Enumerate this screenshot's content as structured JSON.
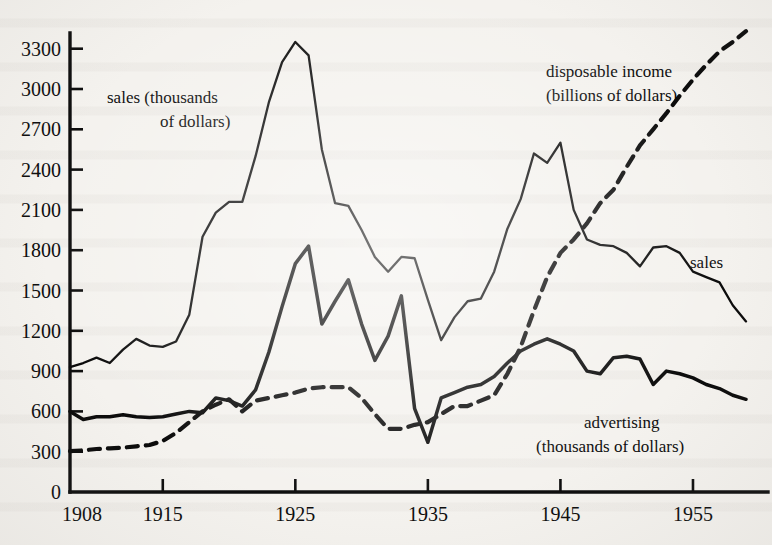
{
  "figure": {
    "background_color": "#f4f2ee",
    "ink_color": "#0b0b0b"
  },
  "axes": {
    "y_ticks": [
      "0",
      "300",
      "600",
      "900",
      "1200",
      "1500",
      "1800",
      "2100",
      "2400",
      "2700",
      "3000",
      "3300"
    ],
    "x_ticks": [
      "1908",
      "1915",
      "1925",
      "1935",
      "1945",
      "1955"
    ]
  },
  "annotations": {
    "sales_main_line1": "sales (thousands",
    "sales_main_line2": "of dollars)",
    "disposable_line1": "disposable income",
    "disposable_line2": "(billions of dollars)",
    "sales_right": "sales",
    "advertising_line1": "advertising",
    "advertising_line2": "(thousands of dollars)"
  },
  "chart_data": {
    "type": "line",
    "title": "",
    "xlabel": "",
    "ylabel": "",
    "xlim": [
      1908,
      1959
    ],
    "ylim": [
      0,
      3450
    ],
    "grid": false,
    "legend": "inline-annotations",
    "x_tick_values": [
      1908,
      1915,
      1925,
      1935,
      1945,
      1955
    ],
    "y_tick_values": [
      0,
      300,
      600,
      900,
      1200,
      1500,
      1800,
      2100,
      2400,
      2700,
      3000,
      3300
    ],
    "x": [
      1908,
      1909,
      1910,
      1911,
      1912,
      1913,
      1914,
      1915,
      1916,
      1917,
      1918,
      1919,
      1920,
      1921,
      1922,
      1923,
      1924,
      1925,
      1926,
      1927,
      1928,
      1929,
      1930,
      1931,
      1932,
      1933,
      1934,
      1935,
      1936,
      1937,
      1938,
      1939,
      1940,
      1941,
      1942,
      1943,
      1944,
      1945,
      1946,
      1947,
      1948,
      1949,
      1950,
      1951,
      1952,
      1953,
      1954,
      1955,
      1956,
      1957,
      1958,
      1959
    ],
    "series": [
      {
        "name": "sales",
        "unit": "thousands of dollars",
        "style": "solid",
        "annotation_left": "sales (thousands of dollars)",
        "annotation_right": "sales",
        "values": [
          930,
          960,
          1000,
          960,
          1060,
          1140,
          1090,
          1080,
          1120,
          1320,
          1900,
          2080,
          2160,
          2160,
          2500,
          2900,
          3200,
          3350,
          3250,
          2550,
          2150,
          2130,
          1950,
          1750,
          1640,
          1750,
          1740,
          1430,
          1130,
          1300,
          1420,
          1440,
          1640,
          1960,
          2180,
          2520,
          2450,
          2600,
          2100,
          1880,
          1840,
          1830,
          1780,
          1680,
          1820,
          1830,
          1780,
          1640,
          1600,
          1560,
          1390,
          1270
        ]
      },
      {
        "name": "advertising",
        "unit": "thousands of dollars",
        "style": "solid",
        "annotation": "advertising (thousands of dollars)",
        "values": [
          600,
          540,
          560,
          560,
          575,
          560,
          555,
          560,
          580,
          600,
          590,
          700,
          680,
          640,
          760,
          1040,
          1380,
          1700,
          1830,
          1250,
          1420,
          1580,
          1250,
          980,
          1160,
          1460,
          620,
          370,
          700,
          740,
          780,
          800,
          860,
          960,
          1050,
          1100,
          1140,
          1100,
          1050,
          900,
          880,
          1000,
          1010,
          990,
          800,
          900,
          880,
          850,
          800,
          770,
          720,
          690
        ]
      },
      {
        "name": "disposable income",
        "unit": "billions of dollars",
        "style": "dashed",
        "annotation": "disposable income (billions of dollars)",
        "values": [
          305,
          310,
          320,
          325,
          330,
          340,
          350,
          380,
          440,
          520,
          600,
          650,
          690,
          600,
          680,
          700,
          720,
          740,
          770,
          780,
          780,
          780,
          700,
          580,
          470,
          470,
          500,
          520,
          580,
          640,
          640,
          680,
          720,
          880,
          1080,
          1350,
          1600,
          1780,
          1880,
          2000,
          2150,
          2250,
          2420,
          2580,
          2700,
          2820,
          2950,
          3070,
          3180,
          3280,
          3350,
          3430
        ]
      }
    ]
  }
}
